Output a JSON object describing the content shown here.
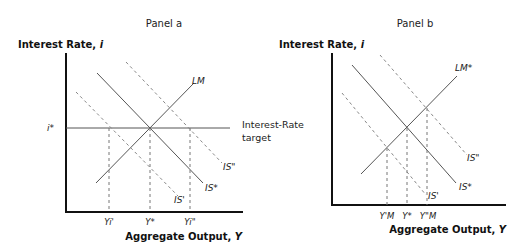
{
  "panel_a": {
    "title": "Panel a",
    "y_axis_title": "Interest Rate, ",
    "y_axis_var": "i",
    "x_axis_title": "Aggregate Output, ",
    "x_axis_var": "Y",
    "i_star_label": "i*",
    "target_label_line1": "Interest-Rate",
    "target_label_line2": "target",
    "curves": {
      "lm": "LM",
      "is_star": "IS*",
      "is_prime": "IS'",
      "is_double_prime": "IS\""
    },
    "x_ticks": [
      "Yi'",
      "Y*",
      "Yi\""
    ]
  },
  "panel_b": {
    "title": "Panel b",
    "y_axis_title": "Interest Rate, ",
    "y_axis_var": "i",
    "x_axis_title": "Aggregate Output, ",
    "x_axis_var": "Y",
    "curves": {
      "lm": "LM*",
      "is_star": "IS*",
      "is_prime": "IS'",
      "is_double_prime": "IS\""
    },
    "x_ticks": [
      "Y'M",
      "Y*",
      "Y\"M"
    ]
  }
}
